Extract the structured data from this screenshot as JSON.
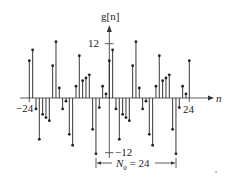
{
  "chart_data": {
    "type": "stem",
    "title": "",
    "ylabel": "g[n]",
    "xlabel": "n",
    "x_tick_labels": [
      "-24",
      "24"
    ],
    "y_tick_labels": [
      "12",
      "-12"
    ],
    "annotation": "N0 = 24",
    "period": 24,
    "xlim": [
      -24,
      24
    ],
    "ylim": [
      -12,
      12
    ],
    "x": [
      -24,
      -23,
      -22,
      -21,
      -20,
      -19,
      -18,
      -17,
      -16,
      -15,
      -14,
      -13,
      -12,
      -11,
      -10,
      -9,
      -8,
      -7,
      -6,
      -5,
      -4,
      -3,
      -2,
      -1,
      0,
      1,
      2,
      3,
      4,
      5,
      6,
      7,
      8,
      9,
      10,
      11,
      12,
      13,
      14,
      15,
      16,
      17,
      18,
      19,
      20,
      21,
      22,
      23,
      24
    ],
    "values": [
      8.2,
      10.6,
      -2.4,
      -9.1,
      -3.6,
      -4.3,
      -5.0,
      7.1,
      12.4,
      2.2,
      -2.4,
      -0.7,
      -8.0,
      -10.4,
      2.6,
      9.3,
      3.8,
      4.4,
      5.1,
      -6.9,
      -12.3,
      -2.1,
      2.6,
      0.9,
      8.2,
      10.6,
      -2.4,
      -9.1,
      -3.6,
      -4.3,
      -5.0,
      7.1,
      12.4,
      2.2,
      -2.4,
      -0.7,
      -8.0,
      -10.4,
      2.6,
      9.3,
      3.8,
      4.4,
      5.1,
      -6.9,
      -12.3,
      -2.1,
      2.6,
      0.9,
      8.2
    ]
  },
  "labels": {
    "y_axis": "g[n]",
    "x_axis": "n",
    "y_tick_top": "12",
    "y_tick_bottom": "−12",
    "x_tick_left": "−24",
    "x_tick_right": "24",
    "period_prefix": "N",
    "period_sub": "0",
    "period_suffix": " = 24",
    "stray_mark": ","
  },
  "colors": {
    "stem": "#222222",
    "axis": "#333333"
  }
}
